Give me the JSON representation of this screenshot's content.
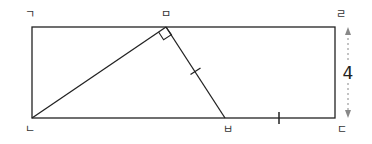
{
  "diagram": {
    "type": "geometry",
    "colors": {
      "line": "#222222",
      "dimension": "#888888",
      "label": "#333333"
    },
    "points": {
      "top_left": {
        "label": "ㄱ",
        "x": 32,
        "y": 27
      },
      "top_mid": {
        "label": "ㅁ",
        "x": 166,
        "y": 27
      },
      "top_right": {
        "label": "ㄹ",
        "x": 335,
        "y": 27
      },
      "bottom_left": {
        "label": "ㄴ",
        "x": 32,
        "y": 118
      },
      "bottom_mid": {
        "label": "ㅂ",
        "x": 225,
        "y": 118
      },
      "bottom_right": {
        "label": "ㄷ",
        "x": 335,
        "y": 118
      }
    },
    "segments": [
      {
        "from": "ㄴ",
        "to": "ㅁ"
      },
      {
        "from": "ㅁ",
        "to": "ㅂ",
        "tick": 1
      },
      {
        "from": "ㅂ",
        "to": "ㄷ",
        "tick": 1
      }
    ],
    "right_angle_at": "ㅁ",
    "dimension": {
      "side": "ㄹㄷ",
      "value": "4"
    }
  }
}
